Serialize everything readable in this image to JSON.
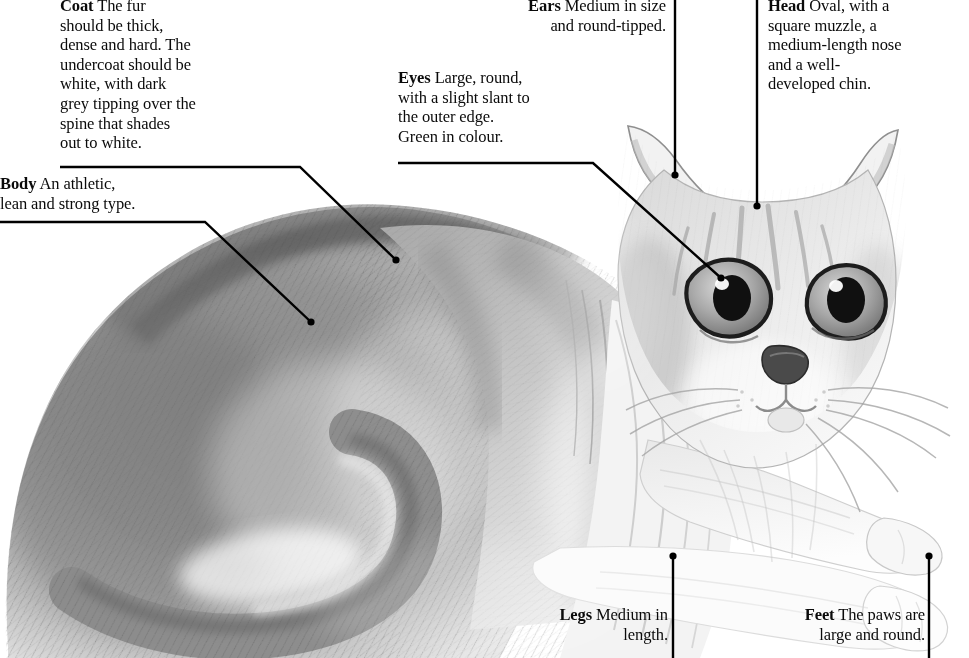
{
  "diagram": {
    "medium": "graphite pencil drawing",
    "background_color": "#ffffff",
    "ink_color": "#000000"
  },
  "callouts": [
    {
      "id": "coat",
      "term": "Coat",
      "text": " The fur\nshould be thick,\ndense and hard. The\nundercoat should be\nwhite, with dark\ngrey tipping over the\nspine that shades\nout to white.",
      "align": "left",
      "leader": {
        "type": "elbow",
        "points": [
          [
            60,
            167
          ],
          [
            300,
            167
          ],
          [
            396,
            260
          ]
        ],
        "dot_at_end": true
      }
    },
    {
      "id": "body",
      "term": "Body",
      "text": " An athletic,\nlean and strong type.",
      "align": "left",
      "leader": {
        "type": "elbow",
        "points": [
          [
            0,
            222
          ],
          [
            205,
            222
          ],
          [
            311,
            322
          ]
        ],
        "dot_at_end": true
      }
    },
    {
      "id": "ears",
      "term": "Ears",
      "text": " Medium in size\nand round-tipped.",
      "align": "right",
      "leader": {
        "type": "vertical",
        "points": [
          [
            675,
            0
          ],
          [
            675,
            175
          ]
        ],
        "dot_at_end": true
      }
    },
    {
      "id": "eyes",
      "term": "Eyes",
      "text": " Large, round,\nwith a slight slant to\nthe outer edge.\nGreen in colour.",
      "align": "left",
      "leader": {
        "type": "elbow",
        "points": [
          [
            398,
            163
          ],
          [
            593,
            163
          ],
          [
            721,
            278
          ]
        ],
        "dot_at_end": true
      }
    },
    {
      "id": "head",
      "term": "Head",
      "text": " Oval, with a\nsquare muzzle, a\nmedium-length nose\nand a well-\ndeveloped chin.",
      "align": "left",
      "leader": {
        "type": "vertical",
        "points": [
          [
            757,
            0
          ],
          [
            757,
            206
          ]
        ],
        "dot_at_end": true
      }
    },
    {
      "id": "legs",
      "term": "Legs",
      "text": " Medium in\nlength.",
      "align": "right",
      "leader": {
        "type": "vertical",
        "points": [
          [
            673,
            556
          ],
          [
            673,
            658
          ]
        ],
        "dot_at_end": true,
        "dot_at_start": true
      }
    },
    {
      "id": "feet",
      "term": "Feet",
      "text": " The paws are\nlarge and round.",
      "align": "right",
      "leader": {
        "type": "vertical",
        "points": [
          [
            929,
            556
          ],
          [
            929,
            658
          ]
        ],
        "dot_at_end": true,
        "dot_at_start": true
      }
    }
  ]
}
